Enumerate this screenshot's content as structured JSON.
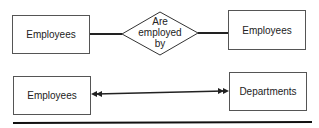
{
  "diagram": {
    "row1": {
      "left_entity": "Employees",
      "relationship": [
        "Are",
        "employed",
        "by"
      ],
      "right_entity": "Employees"
    },
    "row2": {
      "left_entity": "Employees",
      "connector": "double-headed arrow (many-to-many)",
      "right_entity": "Departments"
    }
  }
}
